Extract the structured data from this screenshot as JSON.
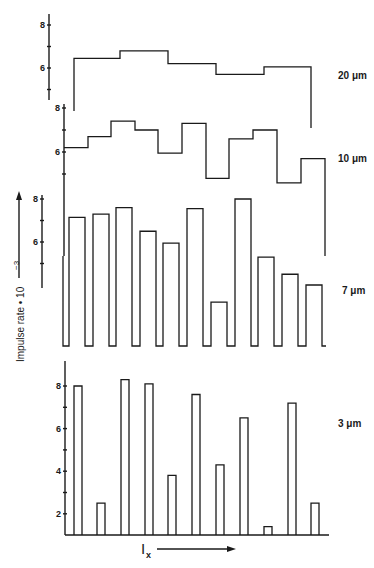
{
  "chart_data": {
    "type": "bar",
    "title": "",
    "ylabel": "Impulse rate • 10⁻³",
    "xlabel": "I",
    "xlabel_subscript": "x",
    "x_direction": "increasing (arrow right)",
    "grid": false,
    "legend": "none (panel labels at right)",
    "panels": [
      {
        "label": "20 μm",
        "style": "step",
        "ylim": [
          5,
          8
        ],
        "yticks": [
          8,
          6
        ],
        "minor_ticks": [
          7,
          5
        ],
        "values": [
          6.45,
          6.8,
          6.2,
          5.7,
          6.05
        ]
      },
      {
        "label": "10 μm",
        "style": "step",
        "ylim": [
          5,
          8
        ],
        "yticks": [
          8,
          6
        ],
        "minor_ticks": [
          7,
          5
        ],
        "values": [
          6.2,
          6.7,
          7.4,
          7.0,
          5.95,
          7.3,
          4.8,
          6.6,
          7.0,
          4.6,
          5.7
        ]
      },
      {
        "label": "7 μm",
        "style": "pulse-bars",
        "ylim": [
          4,
          8
        ],
        "yticks": [
          8,
          6
        ],
        "minor_ticks": [
          7,
          5
        ],
        "values": [
          7.15,
          7.3,
          7.6,
          6.5,
          5.95,
          7.55,
          3.2,
          8.0,
          5.3,
          4.5,
          4.0
        ]
      },
      {
        "label": "3 μm",
        "style": "bars",
        "ylim": [
          1,
          9
        ],
        "yticks": [
          8,
          6,
          4,
          2
        ],
        "minor_ticks": [
          7,
          5,
          3
        ],
        "values": [
          8.0,
          2.5,
          8.3,
          8.1,
          3.8,
          7.6,
          4.3,
          6.5,
          1.4,
          7.2,
          2.5
        ]
      }
    ]
  },
  "labels": {
    "ylabel": "Impulse rate • 10",
    "ylabel_exp": "−3",
    "xlabel": "I",
    "xlabel_sub": "x",
    "p20": "20 μm",
    "p10": "10 μm",
    "p7": "7 μm",
    "p3": "3 μm",
    "t20_8": "8",
    "t20_6": "6",
    "t10_8": "8",
    "t10_6": "6",
    "t7_8": "8",
    "t7_6": "6",
    "t3_8": "8",
    "t3_6": "6",
    "t3_4": "4",
    "t3_2": "2"
  }
}
